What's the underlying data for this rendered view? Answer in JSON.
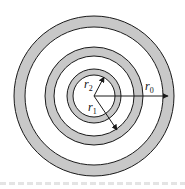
{
  "diagram": {
    "center": {
      "x": 94,
      "y": 96
    },
    "colors": {
      "ring_fill": "#c8c8c8",
      "stroke": "#1a1a1a",
      "background": "#ffffff"
    },
    "rings": [
      {
        "name": "outer-ring",
        "inner_radius": 69,
        "outer_radius": 80
      },
      {
        "name": "middle-ring",
        "inner_radius": 40,
        "outer_radius": 49
      },
      {
        "name": "inner-ring",
        "inner_radius": 21,
        "outer_radius": 27
      }
    ],
    "labels": {
      "r0": {
        "base": "r",
        "sub": "0"
      },
      "r1": {
        "base": "r",
        "sub": "1"
      },
      "r2": {
        "base": "r",
        "sub": "2"
      }
    }
  }
}
